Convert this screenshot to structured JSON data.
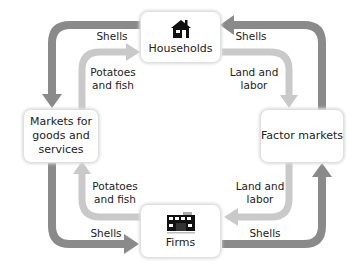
{
  "nodes": {
    "households": {
      "label": "Households",
      "icon": "house-icon"
    },
    "firms": {
      "label": "Firms",
      "icon": "factory-icon"
    },
    "goods_markets": {
      "label_lines": [
        "Markets for",
        "goods and",
        "services"
      ]
    },
    "factor_markets": {
      "label": "Factor markets"
    }
  },
  "flows": {
    "top_left_outer": "Shells",
    "top_left_inner": [
      "Potatoes",
      "and fish"
    ],
    "top_right_outer": "Shells",
    "top_right_inner": [
      "Land and",
      "labor"
    ],
    "bottom_left_inner": [
      "Potatoes",
      "and fish"
    ],
    "bottom_left_outer": "Shells",
    "bottom_right_inner": [
      "Land and",
      "labor"
    ],
    "bottom_right_outer": "Shells"
  },
  "colors": {
    "money_flow": "#8a8a8a",
    "goods_flow": "#c9c9c9"
  }
}
